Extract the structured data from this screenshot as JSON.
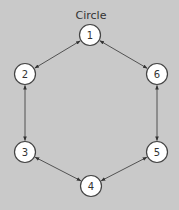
{
  "diagram": {
    "title": "Circle",
    "background": "#c9c9c9",
    "node_fill": "#ffffff",
    "stroke": "#444444",
    "nodes": [
      {
        "id": "1",
        "label": "1",
        "x": 90,
        "y": 35
      },
      {
        "id": "2",
        "label": "2",
        "x": 25,
        "y": 74
      },
      {
        "id": "3",
        "label": "3",
        "x": 25,
        "y": 152
      },
      {
        "id": "4",
        "label": "4",
        "x": 91,
        "y": 186
      },
      {
        "id": "5",
        "label": "5",
        "x": 157,
        "y": 152
      },
      {
        "id": "6",
        "label": "6",
        "x": 157,
        "y": 74
      }
    ],
    "edges": [
      {
        "from": "1",
        "to": "2",
        "direction": "bidirectional"
      },
      {
        "from": "2",
        "to": "3",
        "direction": "bidirectional"
      },
      {
        "from": "3",
        "to": "4",
        "direction": "bidirectional"
      },
      {
        "from": "4",
        "to": "5",
        "direction": "bidirectional"
      },
      {
        "from": "5",
        "to": "6",
        "direction": "bidirectional"
      },
      {
        "from": "6",
        "to": "1",
        "direction": "bidirectional"
      }
    ]
  }
}
